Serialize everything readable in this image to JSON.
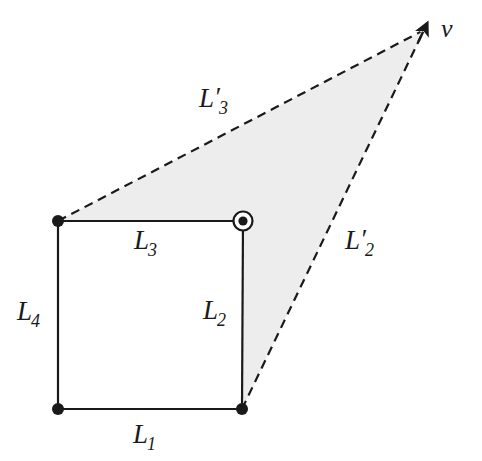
{
  "figure": {
    "background_color": "#ffffff",
    "stroke_color": "#1a1a1a",
    "shade_color": "#ededed",
    "canvas": {
      "width": 482,
      "height": 461
    }
  },
  "geometry": {
    "vertices": {
      "top_left": {
        "name": "top-left-corner",
        "x": 58,
        "y": 221
      },
      "top_right": {
        "name": "top-right-corner",
        "x": 243,
        "y": 221
      },
      "bottom_right": {
        "name": "bottom-right-corner",
        "x": 242,
        "y": 409
      },
      "bottom_left": {
        "name": "bottom-left-corner",
        "x": 58,
        "y": 409
      },
      "vanishing_point": {
        "name": "vanishing-point",
        "x": 424,
        "y": 30
      }
    },
    "solid_edges": [
      {
        "id": "L1",
        "from": "bottom_left",
        "to": "bottom_right"
      },
      {
        "id": "L2",
        "from": "top_right",
        "to": "bottom_right"
      },
      {
        "id": "L3",
        "from": "top_left",
        "to": "top_right"
      },
      {
        "id": "L4",
        "from": "top_left",
        "to": "bottom_left"
      }
    ],
    "dashed_edges": [
      {
        "id": "L3p",
        "from": "top_left",
        "to": "vanishing_point"
      },
      {
        "id": "L2p",
        "from": "bottom_right",
        "to": "vanishing_point"
      }
    ],
    "shaded_polygon": [
      "top_left",
      "top_right",
      "bottom_right",
      "vanishing_point"
    ],
    "dash_pattern": "9 6",
    "stroke_width": 2.2,
    "dot_radius": 6,
    "marked_point": {
      "name": "marked-vertex",
      "at": "top_right",
      "outer_ring_radius": 9.5,
      "inner_dot_radius": 4.6
    },
    "arrow": {
      "name": "vanishing-point-arrowhead",
      "tip_x": 424,
      "tip_y": 30,
      "size": 13
    }
  },
  "labels": {
    "L1": {
      "base": "L",
      "prime": "",
      "sub": "1",
      "x": 133,
      "y": 421
    },
    "L2": {
      "base": "L",
      "prime": "",
      "sub": "2",
      "x": 203,
      "y": 297
    },
    "L3": {
      "base": "L",
      "prime": "",
      "sub": "3",
      "x": 134,
      "y": 227
    },
    "L4": {
      "base": "L",
      "prime": "",
      "sub": "4",
      "x": 17,
      "y": 298
    },
    "L2p": {
      "base": "L",
      "prime": "′",
      "sub": "2",
      "x": 345,
      "y": 227
    },
    "L3p": {
      "base": "L",
      "prime": "′",
      "sub": "3",
      "x": 199,
      "y": 85
    },
    "v": {
      "base": "v",
      "prime": "",
      "sub": "",
      "x": 441,
      "y": 16
    }
  }
}
